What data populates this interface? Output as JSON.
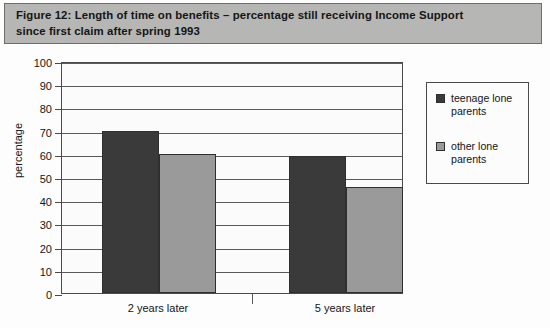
{
  "figure": {
    "title_line1": "Figure 12:  Length of time on benefits – percentage still receiving Income Support",
    "title_line2": "since first claim after spring 1993",
    "band_color": "#b6b6b4"
  },
  "chart_data": {
    "type": "bar",
    "title": "Figure 12:  Length of time on benefits – percentage still receiving Income Support since first claim after spring 1993",
    "xlabel": "",
    "ylabel": "percentage",
    "ylim": [
      0,
      100
    ],
    "ytick_step": 10,
    "yticks": [
      "0",
      "10",
      "20",
      "30",
      "40",
      "50",
      "60",
      "70",
      "80",
      "90",
      "100"
    ],
    "grid": "horizontal",
    "legend_position": "right",
    "categories": [
      "2 years later",
      "5 years later"
    ],
    "series": [
      {
        "name": "teenage lone parents",
        "color": "#3a3a3a",
        "values": [
          70,
          59
        ]
      },
      {
        "name": "other lone parents",
        "color": "#9a9a9a",
        "values": [
          60,
          45.5
        ]
      }
    ]
  },
  "legend": {
    "items": [
      {
        "label": "teenage lone parents",
        "color": "#3a3a3a"
      },
      {
        "label": "other lone parents",
        "color": "#9a9a9a"
      }
    ]
  }
}
